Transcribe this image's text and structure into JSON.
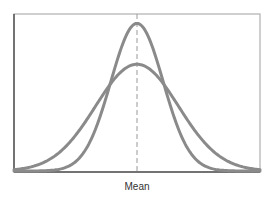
{
  "chart_data": {
    "type": "line",
    "title": "",
    "xlabel": "Mean",
    "ylabel": "",
    "grid": false,
    "legend": null,
    "annotations": [
      {
        "type": "vertical-dashed-line",
        "at": "mean",
        "label": "Mean"
      }
    ],
    "series": [
      {
        "name": "narrow distribution (small spread)",
        "kind": "normal",
        "mean": 0,
        "sd": 0.85,
        "relative_peak": 0.94
      },
      {
        "name": "wide distribution (large spread)",
        "kind": "normal",
        "mean": 0,
        "sd": 1.35,
        "relative_peak": 0.68
      }
    ],
    "x_range": [
      -4,
      4
    ],
    "colors": {
      "curves": "#8a8a8a",
      "axes": "#555555",
      "frame": "#aaaaaa",
      "mean_line": "#999999"
    }
  }
}
